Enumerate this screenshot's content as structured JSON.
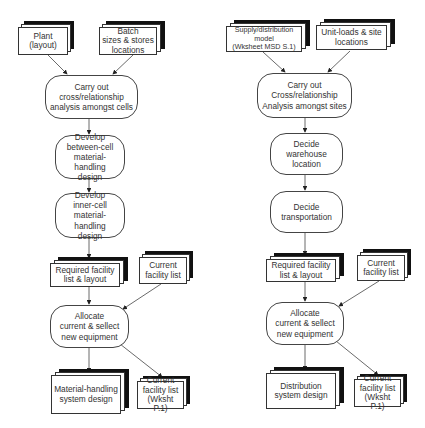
{
  "diagram": {
    "type": "flowchart",
    "left_flow": {
      "inputs": [
        {
          "id": "plant",
          "label": "Plant\n(layout)"
        },
        {
          "id": "batch",
          "label": "Batch\nsizes & stores\nlocations"
        }
      ],
      "process_carry_out": "Carry out\ncross/relationship\nanalysis amongst cells",
      "process_between_cell": "Develop\nbetween-cell\nmaterial-handling\ndesign",
      "process_inner_cell": "Develop\ninner-cell material-\nhandling\ndesign",
      "doc_required": "Required facility\nlist & layout",
      "doc_current": "Current\nfacility list",
      "process_allocate": "Allocate\ncurrent & sellect\nnew equipment",
      "output_design": "Material-handling\nsystem design",
      "output_current": "Current\nfacility list\n(Wksht P.1)"
    },
    "right_flow": {
      "inputs": [
        {
          "id": "supply",
          "label": "Supply/distribution\nmodel\n(Wksheet MSD S.1)"
        },
        {
          "id": "unitloads",
          "label": "Unit-loads  & site\nlocations"
        }
      ],
      "process_carry_out": "Carry out\nCross/relationship\nAnalysis amongst sites",
      "process_warehouse": "Decide warehouse\nlocation",
      "process_transport": "Decide\ntransportation",
      "doc_required": "Required facility\nlist & layout",
      "doc_current": "Current\nfacility list",
      "process_allocate": "Allocate\ncurrent & sellect\nnew equipment",
      "output_design": "Distribution\nsystem design",
      "output_current": "Current\nfacility list\n(Wksht P.1)"
    },
    "colors": {
      "line": "#333333",
      "shadow_sheet": "#111111",
      "background": "#ffffff"
    }
  }
}
